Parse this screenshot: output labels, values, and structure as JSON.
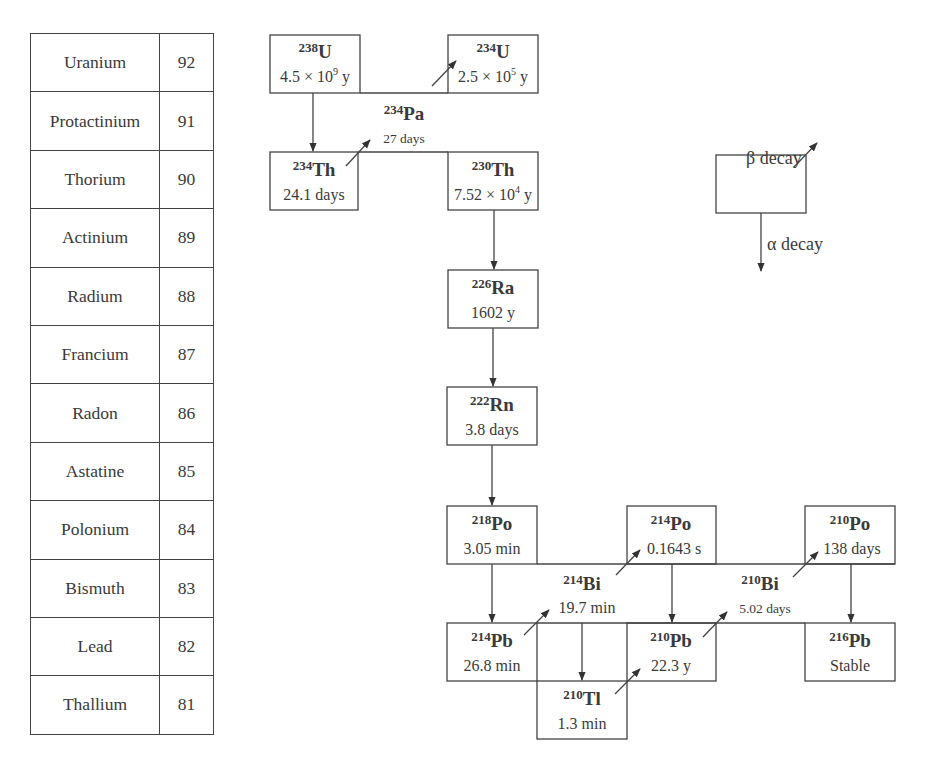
{
  "element_table": {
    "rows": [
      {
        "name": "Uranium",
        "z": "92"
      },
      {
        "name": "Protactinium",
        "z": "91"
      },
      {
        "name": "Thorium",
        "z": "90"
      },
      {
        "name": "Actinium",
        "z": "89"
      },
      {
        "name": "Radium",
        "z": "88"
      },
      {
        "name": "Francium",
        "z": "87"
      },
      {
        "name": "Radon",
        "z": "86"
      },
      {
        "name": "Astatine",
        "z": "85"
      },
      {
        "name": "Polonium",
        "z": "84"
      },
      {
        "name": "Bismuth",
        "z": "83"
      },
      {
        "name": "Lead",
        "z": "82"
      },
      {
        "name": "Thallium",
        "z": "81"
      }
    ]
  },
  "nuclides": {
    "u238": {
      "mass": "238",
      "symbol": "U",
      "half_life_mant": "4.5 × 10",
      "half_life_exp": "9",
      "half_life_unit": " y"
    },
    "u234": {
      "mass": "234",
      "symbol": "U",
      "half_life_mant": "2.5 × 10",
      "half_life_exp": "5",
      "half_life_unit": " y"
    },
    "pa234": {
      "mass": "234",
      "symbol": "Pa",
      "half_life": "27 days"
    },
    "th234": {
      "mass": "234",
      "symbol": "Th",
      "half_life": "24.1 days"
    },
    "th230": {
      "mass": "230",
      "symbol": "Th",
      "half_life_mant": "7.52 × 10",
      "half_life_exp": "4",
      "half_life_unit": " y"
    },
    "ra226": {
      "mass": "226",
      "symbol": "Ra",
      "half_life": "1602 y"
    },
    "rn222": {
      "mass": "222",
      "symbol": "Rn",
      "half_life": "3.8 days"
    },
    "po218": {
      "mass": "218",
      "symbol": "Po",
      "half_life": "3.05 min"
    },
    "po214": {
      "mass": "214",
      "symbol": "Po",
      "half_life": "0.1643 s"
    },
    "po210": {
      "mass": "210",
      "symbol": "Po",
      "half_life": "138 days"
    },
    "bi214": {
      "mass": "214",
      "symbol": "Bi",
      "half_life": "19.7 min"
    },
    "bi210": {
      "mass": "210",
      "symbol": "Bi",
      "half_life": "5.02 days"
    },
    "pb214": {
      "mass": "214",
      "symbol": "Pb",
      "half_life": "26.8 min"
    },
    "pb210": {
      "mass": "210",
      "symbol": "Pb",
      "half_life": "22.3 y"
    },
    "pb216": {
      "mass": "216",
      "symbol": "Pb",
      "half_life": "Stable"
    },
    "tl210": {
      "mass": "210",
      "symbol": "Tl",
      "half_life": "1.3 min"
    }
  },
  "legend": {
    "beta_label": "β decay",
    "alpha_label": "α decay"
  },
  "colors": {
    "line": "#444444",
    "text": "#3a3a3a",
    "background": "#ffffff"
  }
}
